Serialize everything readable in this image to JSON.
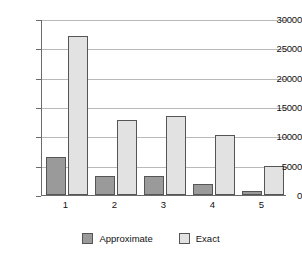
{
  "chart_data": {
    "type": "bar",
    "title": "",
    "subtitle": "",
    "xlabel": "",
    "ylabel": "",
    "categories": [
      "1",
      "2",
      "3",
      "4",
      "5"
    ],
    "series": [
      {
        "name": "Approximate",
        "color": "#9a9a9a",
        "values": [
          6500,
          3250,
          3200,
          1900,
          650
        ]
      },
      {
        "name": "Exact",
        "color": "#e2e2e2",
        "values": [
          27100,
          12800,
          13400,
          10300,
          4900
        ]
      }
    ],
    "ylim": [
      0,
      30000
    ],
    "yticks": [
      0,
      5000,
      10000,
      15000,
      20000,
      25000,
      30000
    ],
    "ytick_labels": [
      "0",
      "5000",
      "10000",
      "15000",
      "20000",
      "25000",
      "30000"
    ],
    "grid": true,
    "grid_axis": "y",
    "legend_position": "bottom"
  }
}
